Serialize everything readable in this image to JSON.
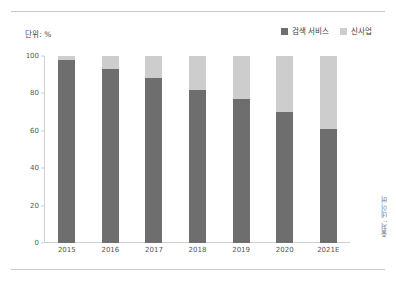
{
  "unit_label": "단위: %",
  "source_note": "출처: 네이버",
  "colors": {
    "series_dark": "#6e6e6e",
    "series_light": "#cdcdcd",
    "axis": "#cfcfcf",
    "text": "#555555",
    "rule": "#c9c9c9",
    "background": "#ffffff"
  },
  "legend": {
    "position": "top-right",
    "items": [
      {
        "label": "검색 서비스",
        "color": "#6e6e6e"
      },
      {
        "label": "신사업",
        "color": "#cdcdcd"
      }
    ]
  },
  "chart_data": {
    "type": "bar",
    "subtype": "stacked-vertical-100percent",
    "title": "",
    "subtitle": "",
    "xlabel": "",
    "ylabel": "",
    "unit": "%",
    "ylim": [
      0,
      100
    ],
    "yticks": [
      0,
      20,
      40,
      60,
      80,
      100
    ],
    "ytick_labels": [
      "0",
      "20",
      "40",
      "60",
      "80",
      "100"
    ],
    "grid": false,
    "legend_position": "top-right",
    "categories": [
      "2015",
      "2016",
      "2017",
      "2018",
      "2019",
      "2020",
      "2021E"
    ],
    "series": [
      {
        "name": "검색 서비스",
        "color": "#6e6e6e",
        "values": [
          98,
          93,
          88,
          82,
          77,
          70,
          61
        ]
      },
      {
        "name": "신사업",
        "color": "#cdcdcd",
        "values": [
          2,
          7,
          12,
          18,
          23,
          30,
          39
        ]
      }
    ],
    "annotations": [
      "단위: %",
      "출처: 네이버"
    ]
  }
}
